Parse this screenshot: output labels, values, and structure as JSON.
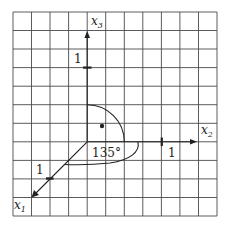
{
  "diagram": {
    "type": "3d-coordinate-axes-on-grid",
    "grid": {
      "columns": 11,
      "rows": 11,
      "left": 13,
      "top": 12,
      "right": 217,
      "bottom": 216,
      "line_color": "#4a4a4a"
    },
    "origin": {
      "x": 87,
      "y": 141
    },
    "axes": [
      {
        "name": "x1",
        "label_main": "x",
        "label_sub": "1",
        "direction": "down-left",
        "tick_label": "1"
      },
      {
        "name": "x2",
        "label_main": "x",
        "label_sub": "2",
        "direction": "right",
        "tick_label": "1"
      },
      {
        "name": "x3",
        "label_main": "x",
        "label_sub": "3",
        "direction": "up",
        "tick_label": "1"
      }
    ],
    "angle_label": "135°",
    "point": {
      "x": 102,
      "y": 126
    },
    "ink_color": "#222222"
  }
}
